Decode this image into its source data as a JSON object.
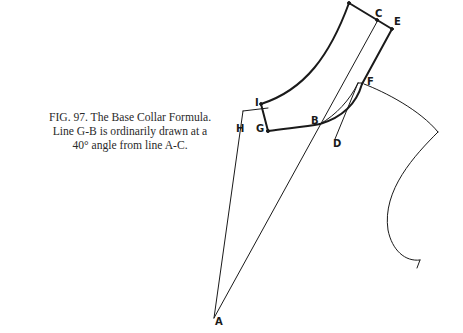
{
  "caption": {
    "lines": [
      "FIG. 97. The Base Collar Formula.",
      "Line G-B is ordinarily drawn at a",
      "40° angle from line A-C."
    ]
  },
  "diagram": {
    "title": "The Base Collar Formula",
    "figure_number": "97",
    "points": {
      "A": "A",
      "B": "B",
      "C": "C",
      "D": "D",
      "E": "E",
      "F": "F",
      "G": "G",
      "H": "H",
      "I": "I"
    },
    "colors": {
      "ink": "#1a1a1a",
      "background": "#ffffff"
    }
  }
}
